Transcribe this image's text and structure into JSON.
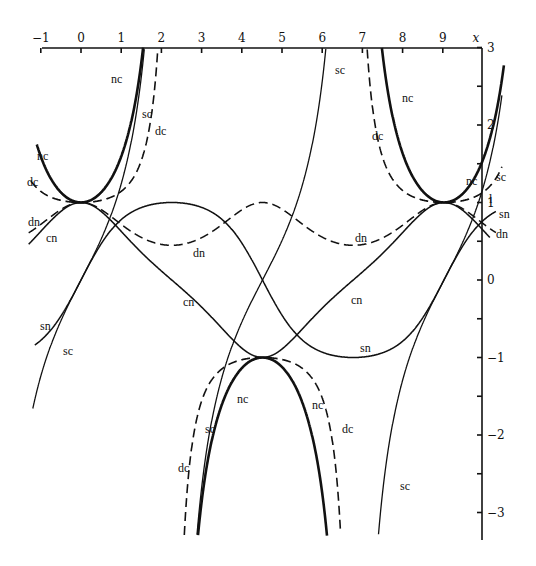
{
  "chart_data": {
    "type": "line",
    "xlabel": "x",
    "ylabel": "",
    "xlim": [
      -1,
      10
    ],
    "ylim": [
      -3.3,
      3
    ],
    "modulus_m": 0.8,
    "quarter_period_K": 2.257,
    "x_ticks": [
      -1,
      0,
      1,
      2,
      3,
      4,
      5,
      6,
      7,
      8,
      9
    ],
    "x_tick_labels": [
      "−1",
      "0",
      "1",
      "2",
      "3",
      "4",
      "5",
      "6",
      "7",
      "8",
      "9"
    ],
    "x_axis_label": "x",
    "y_ticks": [
      3,
      2.5,
      2,
      1.5,
      1,
      0.5,
      0,
      -0.5,
      -1,
      -1.5,
      -2,
      -2.5,
      -3
    ],
    "y_tick_labels": [
      {
        "value": 3,
        "label": "3"
      },
      {
        "value": 2,
        "label": "2"
      },
      {
        "value": 1,
        "label": "1"
      },
      {
        "value": 0,
        "label": "0"
      },
      {
        "value": -1,
        "label": "−1"
      },
      {
        "value": -2,
        "label": "−2"
      },
      {
        "value": -3,
        "label": "−3"
      }
    ],
    "grid": false,
    "legend": "inline labels",
    "series": [
      {
        "name": "sn",
        "style": "solid",
        "width": 1.5,
        "description": "sn(x,k)",
        "key_points": [
          [
            0,
            0
          ],
          [
            2.26,
            1
          ],
          [
            4.51,
            0
          ],
          [
            6.77,
            -1
          ],
          [
            9.03,
            0
          ]
        ]
      },
      {
        "name": "cn",
        "style": "solid",
        "width": 1.5,
        "description": "cn(x,k)",
        "key_points": [
          [
            0,
            1
          ],
          [
            2.26,
            0
          ],
          [
            4.51,
            -1
          ],
          [
            6.77,
            0
          ],
          [
            9.03,
            1
          ]
        ]
      },
      {
        "name": "dn",
        "style": "dashed",
        "width": 1.5,
        "description": "dn(x,k)",
        "key_points": [
          [
            0,
            1
          ],
          [
            2.26,
            0.447
          ],
          [
            4.51,
            1
          ],
          [
            6.77,
            0.447
          ],
          [
            9.03,
            1
          ]
        ]
      },
      {
        "name": "nc",
        "style": "solid",
        "width": 2.6,
        "description": "1/cn(x,k)",
        "key_points": [
          [
            0,
            1
          ],
          [
            4.51,
            -1
          ],
          [
            9.03,
            1
          ]
        ]
      },
      {
        "name": "dc",
        "style": "dashed",
        "width": 1.6,
        "description": "dn/cn",
        "key_points": [
          [
            0,
            1
          ],
          [
            4.51,
            -1
          ],
          [
            9.03,
            1
          ]
        ]
      },
      {
        "name": "sc",
        "style": "solid",
        "width": 1.3,
        "description": "sn/cn",
        "key_points": [
          [
            0,
            0
          ],
          [
            4.51,
            0
          ],
          [
            9.03,
            0
          ]
        ]
      }
    ],
    "annotations": [
      {
        "text": "nc",
        "x": 111,
        "y": 83
      },
      {
        "text": "sc",
        "x": 142,
        "y": 118
      },
      {
        "text": "dc",
        "x": 155,
        "y": 135
      },
      {
        "text": "nc",
        "x": 37,
        "y": 160
      },
      {
        "text": "dc",
        "x": 27,
        "y": 186
      },
      {
        "text": "dn",
        "x": 28,
        "y": 226
      },
      {
        "text": "cn",
        "x": 46,
        "y": 242
      },
      {
        "text": "sn",
        "x": 40,
        "y": 330
      },
      {
        "text": "sc",
        "x": 63,
        "y": 355
      },
      {
        "text": "dn",
        "x": 193,
        "y": 257
      },
      {
        "text": "cn",
        "x": 183,
        "y": 306
      },
      {
        "text": "sc",
        "x": 335,
        "y": 74
      },
      {
        "text": "nc",
        "x": 402,
        "y": 102
      },
      {
        "text": "dc",
        "x": 372,
        "y": 140
      },
      {
        "text": "nc",
        "x": 466,
        "y": 185
      },
      {
        "text": "sc",
        "x": 496,
        "y": 181
      },
      {
        "text": "sn",
        "x": 499,
        "y": 218
      },
      {
        "text": "dn",
        "x": 496,
        "y": 238
      },
      {
        "text": "dn",
        "x": 355,
        "y": 242
      },
      {
        "text": "cn",
        "x": 351,
        "y": 304
      },
      {
        "text": "sn",
        "x": 360,
        "y": 352
      },
      {
        "text": "nc",
        "x": 237,
        "y": 403
      },
      {
        "text": "nc",
        "x": 312,
        "y": 409
      },
      {
        "text": "sc",
        "x": 205,
        "y": 433
      },
      {
        "text": "dc",
        "x": 342,
        "y": 433
      },
      {
        "text": "dc",
        "x": 178,
        "y": 472
      },
      {
        "text": "sc",
        "x": 400,
        "y": 490
      }
    ]
  },
  "layout": {
    "x_origin_px": 81,
    "px_per_x": 40.2,
    "y_origin_px": 280,
    "px_per_y": 77.5,
    "plot_left_px": 42,
    "plot_right_px": 482,
    "plot_top_px": 48,
    "plot_bottom_px": 540
  }
}
